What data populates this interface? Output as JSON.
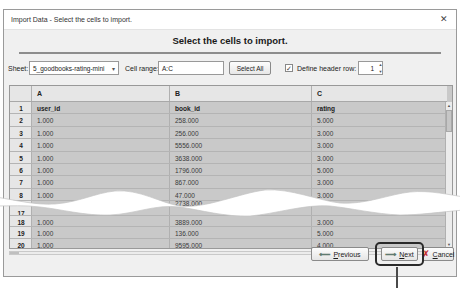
{
  "window": {
    "title": "Import Data - Select the cells to import.",
    "close_icon": "✕"
  },
  "heading": "Select the cells to import.",
  "controls": {
    "sheet_label": "Sheet:",
    "sheet_value": "5_goodbooks-rating-mini",
    "combo_arrow": "▾",
    "cell_range_label": "Cell range:",
    "cell_range_value": "A:C",
    "select_all_label": "Select All",
    "checkbox_mark": "✓",
    "define_header_label": "Define header row:",
    "header_row_value": "1",
    "spin_up": "▲",
    "spin_down": "▼"
  },
  "table": {
    "column_headers": {
      "num": "",
      "a": "A",
      "b": "B",
      "c": "C"
    },
    "rows_top": [
      {
        "num": "1",
        "a": "user_id",
        "b": "book_id",
        "c": "rating"
      },
      {
        "num": "2",
        "a": "1.000",
        "b": "258.000",
        "c": "5.000"
      },
      {
        "num": "3",
        "a": "1.000",
        "b": "256.000",
        "c": "3.000"
      },
      {
        "num": "4",
        "a": "1.000",
        "b": "5556.000",
        "c": "3.000"
      },
      {
        "num": "5",
        "a": "1.000",
        "b": "3638.000",
        "c": "3.000"
      },
      {
        "num": "6",
        "a": "1.000",
        "b": "1796.000",
        "c": "5.000"
      },
      {
        "num": "7",
        "a": "1.000",
        "b": "867.000",
        "c": "3.000"
      },
      {
        "num": "8",
        "a": "1.000",
        "b": "47.000",
        "c": "3.000"
      }
    ],
    "torn_fragment": "2738.000",
    "rows_bottom": [
      {
        "num": "17",
        "a": "",
        "b": "",
        "c": ""
      },
      {
        "num": "18",
        "a": "1.000",
        "b": "3889.000",
        "c": "3.000"
      },
      {
        "num": "19",
        "a": "1.000",
        "b": "136.000",
        "c": "5.000"
      },
      {
        "num": "20",
        "a": "1.000",
        "b": "9595.000",
        "c": "4.000"
      }
    ],
    "scroll_up": "▲",
    "scroll_down": "▼"
  },
  "buttons": {
    "previous": "Previous",
    "previous_icon": "⟵",
    "next": "Next",
    "next_icon": "⟶",
    "cancel": "Cancel",
    "cancel_icon": "✗"
  },
  "colors": {
    "selection_gray": "#c9c9c9",
    "dialog_bg": "#f0f0f0",
    "cancel_red": "#c32f2f",
    "next_ring": "#2a2a2a"
  }
}
